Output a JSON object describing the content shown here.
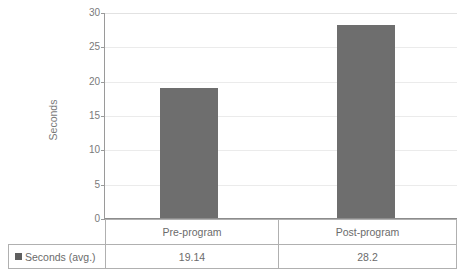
{
  "chart_data": {
    "type": "bar",
    "title": "",
    "categories": [
      "Pre-program",
      "Post-program"
    ],
    "series": [
      {
        "name": "Seconds (avg.)",
        "values": [
          19.14,
          28.2
        ],
        "value_labels": [
          "19.14",
          "28.2"
        ],
        "color": "#6e6e6e"
      }
    ],
    "xlabel": "",
    "ylabel": "Seconds",
    "ylim": [
      0,
      30
    ],
    "ytick_step": 5,
    "yticks": [
      30,
      25,
      20,
      15,
      10,
      5,
      0
    ],
    "ytick_labels": [
      "30",
      "25",
      "20",
      "15",
      "10",
      "5",
      "0"
    ],
    "grid": true,
    "grid_axis": "y",
    "legend_position": "data-table",
    "data_table_visible": true
  },
  "axis": {
    "y_title": "Seconds"
  },
  "table": {
    "legend_label": "Seconds (avg.)",
    "columns": [
      "Pre-program",
      "Post-program"
    ],
    "rows": [
      {
        "label": "Seconds (avg.)",
        "cells": [
          "19.14",
          "28.2"
        ]
      }
    ]
  },
  "colors": {
    "bar": "#6e6e6e",
    "gridline": "#ebebeb",
    "axis": "#8c8c8c",
    "table_border": "#b0b0b0",
    "text": "#6b6b6b"
  }
}
